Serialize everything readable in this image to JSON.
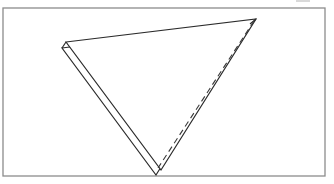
{
  "figure": {
    "canvas": {
      "width": 334,
      "height": 184
    },
    "background_color": "#ffffff",
    "ink_color": "#2b2b2b",
    "frame_color": "#8c8c8c",
    "dashed_color": "#3a3a3a"
  },
  "frame": {
    "label": "border-frame",
    "x": 3,
    "y": 8,
    "width": 322,
    "height": 168,
    "stroke_width": 1.3
  },
  "shapes": {
    "triangle_front": {
      "label": "front-triangle",
      "points": "66,42 256,19 161,170",
      "stroke_width": 1.2,
      "fill": "none"
    },
    "triangle_back": {
      "label": "back-triangle",
      "points": "62,48 250,24 156,175",
      "stroke_width": 1.2,
      "fill": "none"
    },
    "connector_top_left": {
      "label": "top-left-connector",
      "x1": 66,
      "y1": 42,
      "x2": 62,
      "y2": 48,
      "stroke_width": 1.2
    },
    "connector_top_right": {
      "label": "top-right-connector",
      "x1": 256,
      "y1": 19,
      "x2": 250,
      "y2": 24,
      "stroke_width": 1.2
    },
    "dashed_edge": {
      "label": "dashed-right-edge",
      "x1": 254,
      "y1": 21,
      "x2": 158,
      "y2": 168,
      "stroke_width": 1.1,
      "dash_pattern": "6 4"
    }
  },
  "artifacts": {
    "top_speck": {
      "label": "scan-speck",
      "x": 296,
      "y": 0,
      "width": 14,
      "height": 2
    }
  }
}
